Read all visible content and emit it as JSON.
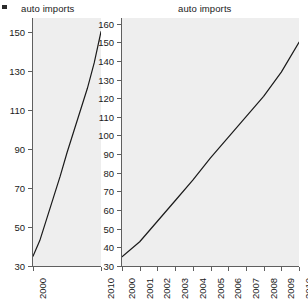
{
  "figure": {
    "corner_mark": "bullet-mark",
    "background_color": "#ffffff",
    "panel_fill_color": "#eeeeee",
    "line_color": "#1a1a1a",
    "axis_color": "#5f5f5f"
  },
  "panels": [
    {
      "id": "left",
      "title": "auto imports",
      "aspect": "tall-narrow"
    },
    {
      "id": "right",
      "title": "auto imports",
      "aspect": "wide-banked"
    }
  ],
  "chart_data": [
    {
      "type": "line",
      "title": "auto imports",
      "xlabel": "",
      "ylabel": "",
      "x": [
        2000,
        2001,
        2002,
        2003,
        2004,
        2005,
        2006,
        2007,
        2008,
        2009,
        2010
      ],
      "values": [
        35,
        43,
        54,
        65,
        76,
        88,
        99,
        110,
        121,
        134,
        150
      ],
      "xlim": [
        2000,
        2010
      ],
      "ylim": [
        30,
        157
      ],
      "xticks": [
        2000,
        2010
      ],
      "xticklabels": [
        "2000",
        "2010"
      ],
      "yticks": [
        30,
        50,
        70,
        90,
        110,
        130,
        150
      ],
      "yticklabels": [
        "30",
        "50",
        "70",
        "90",
        "110",
        "130",
        "150"
      ],
      "grid": false,
      "legend": "none"
    },
    {
      "type": "line",
      "title": "auto imports",
      "xlabel": "",
      "ylabel": "",
      "x": [
        2000,
        2001,
        2002,
        2003,
        2004,
        2005,
        2006,
        2007,
        2008,
        2009,
        2010
      ],
      "values": [
        35,
        43,
        54,
        65,
        76,
        88,
        99,
        110,
        121,
        134,
        150
      ],
      "xlim": [
        2000,
        2010
      ],
      "ylim": [
        30,
        163
      ],
      "xticks": [
        2000,
        2001,
        2002,
        2003,
        2004,
        2005,
        2006,
        2007,
        2008,
        2009,
        2010
      ],
      "xticklabels": [
        "2000",
        "2001",
        "2002",
        "2003",
        "2004",
        "2005",
        "2006",
        "2007",
        "2008",
        "2009",
        "2010"
      ],
      "yticks": [
        30,
        40,
        50,
        60,
        70,
        80,
        90,
        100,
        110,
        120,
        130,
        140,
        150,
        160
      ],
      "yticklabels": [
        "30",
        "40",
        "50",
        "60",
        "70",
        "80",
        "90",
        "100",
        "110",
        "120",
        "130",
        "140",
        "150",
        "160"
      ],
      "grid": false,
      "legend": "none"
    }
  ]
}
